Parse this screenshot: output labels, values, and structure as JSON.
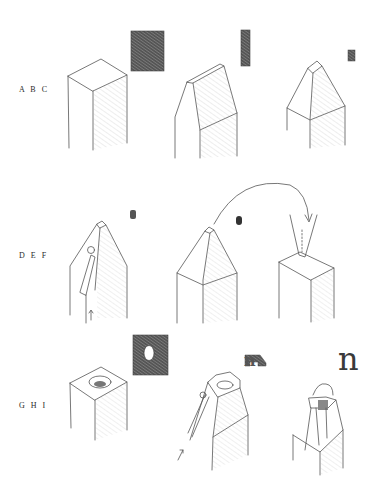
{
  "figure": {
    "rows": [
      {
        "label": "A B C",
        "steps": [
          "A",
          "B",
          "C"
        ]
      },
      {
        "label": "D E F",
        "steps": [
          "D",
          "E",
          "F"
        ]
      },
      {
        "label": "G H I",
        "steps": [
          "G",
          "H",
          "I"
        ]
      }
    ],
    "final_glyph": "n",
    "colors": {
      "stroke": "#555555",
      "hatch": "#999999",
      "dark": "#3a3a3a",
      "background": "#ffffff"
    }
  }
}
